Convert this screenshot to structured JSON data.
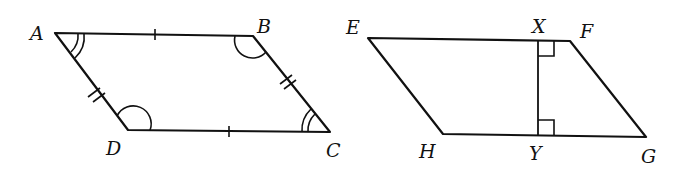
{
  "figures": [
    {
      "name": "parallelogram-ABCD",
      "vertices": [
        {
          "label": "A",
          "x": 55,
          "y": 33
        },
        {
          "label": "B",
          "x": 253,
          "y": 36
        },
        {
          "label": "C",
          "x": 330,
          "y": 132
        },
        {
          "label": "D",
          "x": 128,
          "y": 130
        }
      ],
      "marks": {
        "single_tick_sides": [
          "AB",
          "DC"
        ],
        "double_tick_sides": [
          "AD",
          "BC"
        ],
        "double_arc_angles": [
          "A",
          "C"
        ],
        "single_arc_angles": [
          "B",
          "D"
        ]
      }
    },
    {
      "name": "parallelogram-EFGH",
      "vertices": [
        {
          "label": "E",
          "x": 368,
          "y": 38
        },
        {
          "label": "F",
          "x": 570,
          "y": 41
        },
        {
          "label": "G",
          "x": 646,
          "y": 137
        },
        {
          "label": "H",
          "x": 443,
          "y": 134
        }
      ],
      "height_segment": {
        "from": "X",
        "to": "Y"
      },
      "points": [
        {
          "label": "X",
          "x": 538,
          "y": 40
        },
        {
          "label": "Y",
          "x": 538,
          "y": 135
        }
      ],
      "marks": {
        "right_angles": [
          "X",
          "Y"
        ]
      }
    }
  ],
  "labels": {
    "A": "A",
    "B": "B",
    "C": "C",
    "D": "D",
    "E": "E",
    "F": "F",
    "G": "G",
    "H": "H",
    "X": "X",
    "Y": "Y"
  }
}
